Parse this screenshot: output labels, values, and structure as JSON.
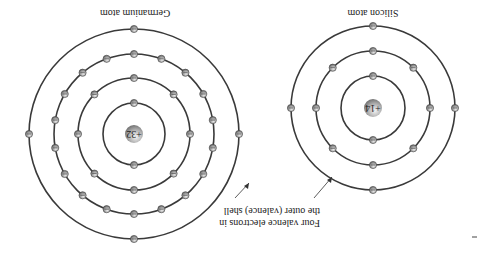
{
  "figure": {
    "orientation": "rotated 180 degrees",
    "germanium": {
      "title": "Germanium atom",
      "nucleus_label": "+32",
      "shells": [
        {
          "radius": 31,
          "electrons": 2
        },
        {
          "radius": 56,
          "electrons": 8
        },
        {
          "radius": 80,
          "electrons": 18
        },
        {
          "radius": 105,
          "electrons": 4
        }
      ]
    },
    "silicon": {
      "title": "Silicon atom",
      "nucleus_label": "+14",
      "shells": [
        {
          "radius": 32,
          "electrons": 2
        },
        {
          "radius": 57,
          "electrons": 8
        },
        {
          "radius": 82,
          "electrons": 4
        }
      ]
    },
    "annotation": {
      "line1": "Four valence electrons in",
      "line2": "the outer (valence) shell"
    },
    "colors": {
      "shell": "#3a3a3a",
      "electron": "#9a9a9a",
      "nucleus": "#b0b0b0"
    }
  }
}
